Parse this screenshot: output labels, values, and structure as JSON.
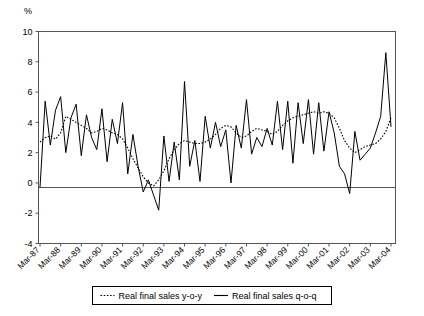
{
  "chart_data": {
    "type": "line",
    "title": "",
    "xlabel": "",
    "ylabel": "%",
    "ylim": [
      -4,
      10
    ],
    "yticks": [
      10,
      8,
      6,
      4,
      2,
      0,
      -2,
      -4
    ],
    "ytick_labels": [
      "10",
      "8",
      "6",
      "4",
      "2",
      "0",
      "-2",
      "-4"
    ],
    "grid": false,
    "legend_position": "bottom",
    "x_axis_type": "quarterly",
    "x_start": "Mar-87",
    "x_end": "Mar-04",
    "xtick_labels": [
      "Mar-87",
      "Mar-88",
      "Mar-89",
      "Mar-90",
      "Mar-91",
      "Mar-92",
      "Mar-93",
      "Mar-94",
      "Mar-95",
      "Mar-96",
      "Mar-97",
      "Mar-98",
      "Mar-99",
      "Mar-00",
      "Mar-01",
      "Mar-02",
      "Mar-03",
      "Mar-04"
    ],
    "series": [
      {
        "name": "Real final sales y-o-y",
        "style": "dotted",
        "color": "#000000",
        "values": [
          2.7,
          3.0,
          3.1,
          2.9,
          3.3,
          4.4,
          4.2,
          4.0,
          3.8,
          3.6,
          3.3,
          3.4,
          3.6,
          3.5,
          3.3,
          3.2,
          2.9,
          2.3,
          1.6,
          1.0,
          0.4,
          0.0,
          -0.2,
          0.2,
          0.8,
          1.6,
          2.2,
          2.6,
          2.8,
          2.7,
          2.6,
          2.6,
          2.7,
          2.9,
          3.2,
          3.6,
          3.8,
          3.7,
          3.3,
          3.0,
          3.1,
          3.4,
          3.6,
          3.5,
          3.4,
          3.2,
          3.4,
          3.8,
          4.1,
          4.3,
          4.4,
          4.5,
          4.6,
          4.7,
          4.6,
          4.7,
          4.6,
          4.3,
          3.6,
          2.8,
          2.3,
          2.0,
          2.2,
          2.4,
          2.5,
          2.6,
          2.9,
          3.4,
          4.3
        ]
      },
      {
        "name": "Real final sales q-o-q",
        "style": "solid",
        "color": "#000000",
        "values": [
          -0.3,
          5.4,
          2.5,
          4.8,
          5.7,
          2.0,
          4.3,
          5.2,
          1.8,
          4.5,
          3.0,
          2.2,
          4.9,
          1.4,
          4.2,
          2.6,
          5.3,
          0.6,
          3.2,
          1.1,
          -0.6,
          0.2,
          -0.8,
          -1.8,
          3.1,
          0.1,
          2.7,
          0.2,
          6.7,
          1.1,
          2.8,
          0.1,
          4.4,
          2.3,
          4.0,
          2.4,
          3.5,
          0.0,
          3.8,
          2.3,
          5.5,
          1.9,
          3.0,
          2.4,
          3.6,
          2.5,
          5.4,
          2.2,
          5.4,
          1.3,
          5.3,
          2.6,
          5.5,
          1.9,
          5.3,
          2.1,
          4.7,
          3.3,
          1.1,
          0.6,
          -0.7,
          3.4,
          1.5,
          1.9,
          2.3,
          3.3,
          4.4,
          8.6,
          3.7
        ]
      }
    ]
  },
  "legend": {
    "items": [
      {
        "label": "Real final sales y-o-y",
        "marker": "dotted-line"
      },
      {
        "label": "Real final sales q-o-q",
        "marker": "solid-line"
      }
    ]
  },
  "axis": {
    "unit_label": "%"
  }
}
